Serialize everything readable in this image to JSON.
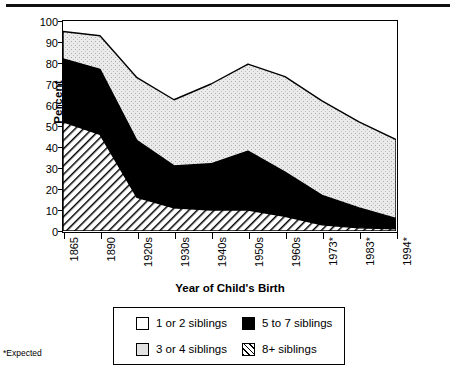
{
  "footnote": "*Expected",
  "axes": {
    "ylabel": "Percent",
    "xlabel": "Year of Child's Birth",
    "yticks": [
      "0",
      "10",
      "20",
      "30",
      "40",
      "50",
      "60",
      "70",
      "80",
      "90",
      "100"
    ]
  },
  "legend": {
    "items": [
      {
        "label": "1 or 2 siblings",
        "swatch": "white-square-icon"
      },
      {
        "label": "5 to 7 siblings",
        "swatch": "black-square-icon"
      },
      {
        "label": "3 or 4 siblings",
        "swatch": "gray-square-icon"
      },
      {
        "label": "8+ siblings",
        "swatch": "hatched-square-icon"
      }
    ]
  },
  "chart_data": {
    "type": "area",
    "title": "",
    "xlabel": "Year of Child's Birth",
    "ylabel": "Percent",
    "ylim": [
      0,
      100
    ],
    "grid": false,
    "stacked": true,
    "legend_position": "bottom",
    "categories": [
      "1865",
      "1890",
      "1920s",
      "1930s",
      "1940s",
      "1950s",
      "1960s",
      "1973*",
      "1983*",
      "1994*"
    ],
    "series": [
      {
        "name": "8+ siblings",
        "fill": "hatch",
        "values": [
          52,
          46,
          16,
          11,
          10,
          10,
          7,
          3,
          1.5,
          1
        ]
      },
      {
        "name": "5 to 7 siblings",
        "fill": "black",
        "values": [
          30,
          31,
          27,
          20,
          22,
          28,
          21,
          14,
          9.5,
          5
        ]
      },
      {
        "name": "3 or 4 siblings",
        "fill": "gray",
        "values": [
          13,
          16,
          30,
          31.5,
          38,
          41.5,
          45.5,
          45,
          41,
          37.5
        ]
      },
      {
        "name": "1 or 2 siblings",
        "fill": "white",
        "values": [
          5,
          7,
          27,
          37.5,
          30,
          20.5,
          26.5,
          38,
          48,
          56.5
        ]
      }
    ],
    "cumulative_tops": {
      "8+ siblings": [
        52,
        46,
        16,
        11,
        10,
        10,
        7,
        3,
        1.5,
        1
      ],
      "5 to 7 siblings": [
        82,
        77,
        43,
        31,
        32,
        38,
        28,
        17,
        11,
        6
      ],
      "3 or 4 siblings": [
        95,
        93,
        73,
        62.5,
        70,
        79.5,
        73.5,
        62,
        52,
        43.5
      ],
      "1 or 2 siblings": [
        100,
        100,
        100,
        100,
        100,
        100,
        100,
        100,
        100,
        100
      ]
    }
  }
}
